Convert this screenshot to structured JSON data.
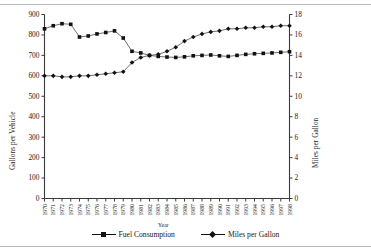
{
  "chart_data": {
    "type": "line",
    "title": "",
    "xlabel": "Year",
    "ylabel": "Gallons per Vehicle",
    "ylabel_right": "Miles per Gallon",
    "grid": false,
    "legend_position": "bottom",
    "ylim": [
      0,
      900
    ],
    "ylim_right": [
      0,
      18
    ],
    "yticks": [
      0,
      100,
      200,
      300,
      400,
      500,
      600,
      700,
      800,
      900
    ],
    "yticks_right": [
      0,
      2,
      4,
      6,
      8,
      10,
      12,
      14,
      16,
      18
    ],
    "categories": [
      "1970",
      "1971",
      "1972",
      "1973",
      "1974",
      "1975",
      "1976",
      "1977",
      "1978",
      "1979",
      "1980",
      "1981",
      "1982",
      "1983",
      "1984",
      "1985",
      "1986",
      "1987",
      "1988",
      "1989",
      "1990",
      "1991",
      "1992",
      "1993",
      "1994",
      "1995",
      "1996",
      "1997",
      "1998"
    ],
    "series": [
      {
        "name": "Fuel Consumption",
        "axis": "left",
        "marker": "square",
        "values": [
          830,
          845,
          855,
          852,
          790,
          795,
          805,
          812,
          820,
          785,
          720,
          712,
          700,
          695,
          692,
          690,
          693,
          698,
          700,
          702,
          698,
          695,
          700,
          705,
          708,
          710,
          712,
          715,
          718
        ]
      },
      {
        "name": "Miles per Gallon",
        "axis": "right",
        "marker": "diamond",
        "values": [
          12.0,
          12.0,
          11.9,
          11.9,
          12.0,
          12.0,
          12.1,
          12.2,
          12.3,
          12.4,
          13.3,
          13.8,
          14.0,
          14.1,
          14.4,
          14.8,
          15.4,
          15.8,
          16.1,
          16.3,
          16.4,
          16.6,
          16.6,
          16.7,
          16.7,
          16.8,
          16.8,
          16.9,
          16.9
        ]
      }
    ]
  },
  "legend": {
    "items": [
      {
        "label": "Fuel Consumption",
        "marker": "square"
      },
      {
        "label": "Miles per Gallon",
        "marker": "diamond"
      }
    ]
  }
}
